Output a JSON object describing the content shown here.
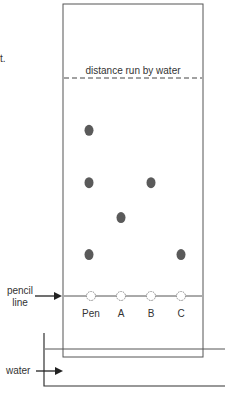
{
  "fragment_text": "t.",
  "solvent_front_label": "distance run by water",
  "pencil_line_label": [
    "pencil",
    "line"
  ],
  "water_label": "water",
  "lanes": [
    {
      "label": "Pen",
      "spots": [
        0.76,
        0.52,
        0.19
      ]
    },
    {
      "label": "A",
      "spots": [
        0.36
      ]
    },
    {
      "label": "B",
      "spots": [
        0.52
      ]
    },
    {
      "label": "C",
      "spots": [
        0.19
      ]
    }
  ],
  "colors": {
    "spot": "#5a5a5a",
    "line": "#444444"
  }
}
